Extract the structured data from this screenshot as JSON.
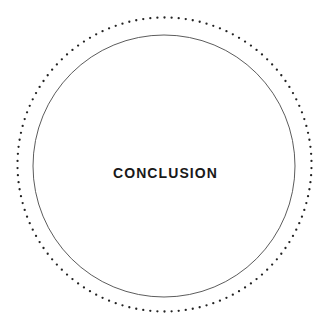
{
  "page": {
    "background_color": "#ffffff",
    "width": 329,
    "height": 332
  },
  "decoration": {
    "dotted_ring": {
      "name": "dotted-ring",
      "center_x": 164.5,
      "center_y": 164.5,
      "radius": 147,
      "dot_count": 130,
      "dot_radius": 1.15,
      "color": "#222222"
    },
    "solid_circle": {
      "name": "solid-circle",
      "center_x": 164,
      "center_y": 166,
      "radius": 131,
      "stroke_width": 0.9,
      "color": "#4a4a4a",
      "fill": "none"
    }
  },
  "main": {
    "title": "Conclusion",
    "title_display": "CONCLUSION",
    "title_color": "#191919"
  }
}
